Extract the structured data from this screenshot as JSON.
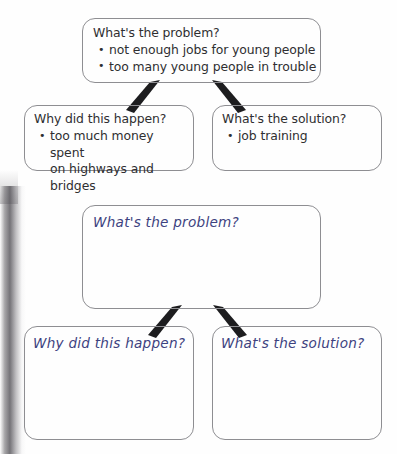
{
  "page": {
    "width": 397,
    "height": 454,
    "background": "#fefefe",
    "ink_color": "#2f2f31",
    "handwriting_color": "#3d4280",
    "box_border_color": "#8e8e92",
    "connector_color": "#1d1d1f"
  },
  "example_diagram": {
    "problem_box": {
      "heading": "What's the problem?",
      "bullets": [
        "not enough jobs for young people",
        "too many young people in trouble"
      ]
    },
    "cause_box": {
      "heading": "Why did this happen?",
      "bullets": [
        "too much money spent\non highways and bridges"
      ]
    },
    "solution_box": {
      "heading": "What's the solution?",
      "bullets": [
        "job training"
      ]
    }
  },
  "blank_template": {
    "problem_box": {
      "heading": "What's the problem?"
    },
    "cause_box": {
      "heading": "Why did this happen?"
    },
    "solution_box": {
      "heading": "What's the solution?"
    }
  }
}
